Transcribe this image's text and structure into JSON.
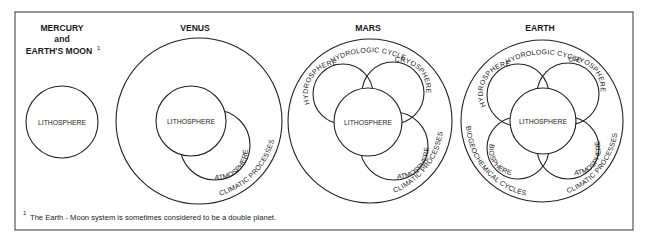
{
  "diagram": {
    "footnote": {
      "marker": "1",
      "text": "The Earth - Moon system is sometimes considered to be a double planet."
    },
    "panels": [
      {
        "id": "mercury",
        "title_lines": [
          "MERCURY",
          "and",
          "EARTH'S MOON"
        ],
        "title_superscript": "1",
        "spheres": [
          "LITHOSPHERE"
        ],
        "processes": []
      },
      {
        "id": "venus",
        "title_lines": [
          "VENUS"
        ],
        "spheres": [
          "LITHOSPHERE",
          "ATMOSPHERE"
        ],
        "processes": [
          "CLIMATIC PROCESSES"
        ]
      },
      {
        "id": "mars",
        "title_lines": [
          "MARS"
        ],
        "spheres": [
          "LITHOSPHERE",
          "HYDROSPHERE",
          "CRYOSPHERE",
          "ATMOSPHERE"
        ],
        "processes": [
          "HYDROLOGIC CYCLE",
          "CLIMATIC PROCESSES"
        ]
      },
      {
        "id": "earth",
        "title_lines": [
          "EARTH"
        ],
        "spheres": [
          "LITHOSPHERE",
          "HYDROSPHERE",
          "CRYOSPHERE",
          "BIOSPHERE",
          "ATMOSPHERE"
        ],
        "processes": [
          "HYDROLOGIC CYCLE",
          "BIOGEOCHEMICAL CYCLES",
          "CLIMATIC PROCESSES"
        ]
      }
    ]
  }
}
